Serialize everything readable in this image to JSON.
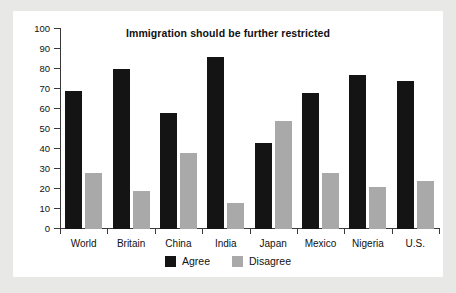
{
  "chart_data": {
    "type": "bar",
    "title": "Immigration should be further restricted",
    "xlabel": "",
    "ylabel": "",
    "ylim": [
      0,
      100
    ],
    "yticks": [
      0,
      10,
      20,
      30,
      40,
      50,
      60,
      70,
      80,
      90,
      100
    ],
    "grid": false,
    "legend_position": "bottom-center",
    "categories": [
      "World",
      "Britain",
      "China",
      "India",
      "Japan",
      "Mexico",
      "Nigeria",
      "U.S."
    ],
    "series": [
      {
        "name": "Agree",
        "color": "#141414",
        "values": [
          69,
          80,
          58,
          86,
          43,
          68,
          77,
          74
        ]
      },
      {
        "name": "Disagree",
        "color": "#a9a9a9",
        "values": [
          28,
          19,
          38,
          13,
          54,
          28,
          21,
          24
        ]
      }
    ]
  },
  "colors": {
    "page_background": "#e8e8e6",
    "card_background": "#ffffff",
    "axis": "#3a3a3a",
    "text": "#111111"
  }
}
